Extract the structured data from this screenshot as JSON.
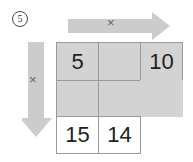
{
  "problem": {
    "number": "5"
  },
  "arrows": {
    "horizontal": {
      "label": "×",
      "direction": "right"
    },
    "vertical": {
      "label": "×",
      "direction": "down"
    },
    "color": "#cccccc"
  },
  "grid": {
    "rows": [
      [
        "5",
        "",
        "10"
      ],
      [
        "",
        "",
        ""
      ],
      [
        "15",
        "14"
      ]
    ],
    "shaded_color": "#d3d3d3",
    "border_color": "#9a9a9a"
  }
}
